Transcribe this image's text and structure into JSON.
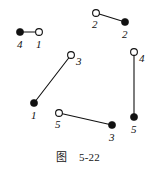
{
  "figure": {
    "caption": "图    5-22",
    "caption_label": "图",
    "caption_number": "5-22",
    "background_color": "#ffffff",
    "ink_color": "#111111",
    "width": 156,
    "height": 171
  },
  "chart_data": {
    "type": "diagram",
    "diagram_kind": "graph-matching",
    "title": "图    5-22",
    "node_styles": [
      "filled",
      "open"
    ],
    "nodes": [
      {
        "id": "n1",
        "label": "4",
        "style": "filled",
        "x": 20,
        "y": 32,
        "label_x": 17,
        "label_y": 39
      },
      {
        "id": "n2",
        "label": "1",
        "style": "open",
        "x": 39,
        "y": 32,
        "label_x": 36,
        "label_y": 39
      },
      {
        "id": "n3",
        "label": "2",
        "style": "open",
        "x": 96,
        "y": 13,
        "label_x": 92,
        "label_y": 19
      },
      {
        "id": "n4",
        "label": "2",
        "style": "filled",
        "x": 125,
        "y": 22,
        "label_x": 122,
        "label_y": 29
      },
      {
        "id": "n5",
        "label": "3",
        "style": "open",
        "x": 71,
        "y": 55,
        "label_x": 76,
        "label_y": 56
      },
      {
        "id": "n6",
        "label": "1",
        "style": "filled",
        "x": 34,
        "y": 103,
        "label_x": 31,
        "label_y": 110
      },
      {
        "id": "n7",
        "label": "5",
        "style": "open",
        "x": 59,
        "y": 113,
        "label_x": 55,
        "label_y": 119
      },
      {
        "id": "n8",
        "label": "3",
        "style": "filled",
        "x": 112,
        "y": 125,
        "label_x": 109,
        "label_y": 132
      },
      {
        "id": "n9",
        "label": "4",
        "style": "open",
        "x": 134,
        "y": 52,
        "label_x": 139,
        "label_y": 53
      },
      {
        "id": "n10",
        "label": "5",
        "style": "filled",
        "x": 134,
        "y": 117,
        "label_x": 131,
        "label_y": 124
      }
    ],
    "edges": [
      {
        "id": "e1",
        "from": "n1",
        "to": "n2",
        "x1": 20,
        "y1": 32,
        "x2": 39,
        "y2": 32
      },
      {
        "id": "e2",
        "from": "n3",
        "to": "n4",
        "x1": 96,
        "y1": 13,
        "x2": 125,
        "y2": 22
      },
      {
        "id": "e3",
        "from": "n6",
        "to": "n5",
        "x1": 34,
        "y1": 103,
        "x2": 71,
        "y2": 55
      },
      {
        "id": "e4",
        "from": "n7",
        "to": "n8",
        "x1": 59,
        "y1": 113,
        "x2": 112,
        "y2": 125
      },
      {
        "id": "e5",
        "from": "n9",
        "to": "n10",
        "x1": 134,
        "y1": 52,
        "x2": 134,
        "y2": 117
      }
    ],
    "node_radius_filled": 3.6,
    "node_radius_open": 3.4,
    "edge_width": 1.1,
    "grid": false,
    "legend": null
  }
}
